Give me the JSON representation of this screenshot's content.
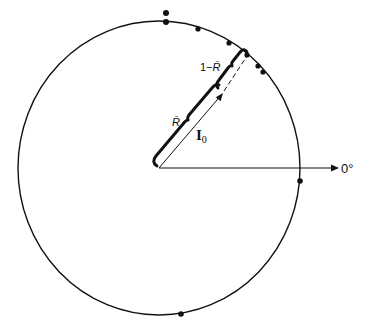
{
  "diagram": {
    "type": "phase-circle",
    "colors": {
      "ink": "#111111",
      "background": "#ffffff"
    },
    "labels": {
      "zero_angle": "0°",
      "mean_vector": "I",
      "mean_vector_subscript": "0",
      "resultant_length": "R̄",
      "complement_prefix": "1−",
      "complement_symbol": "R̄"
    },
    "circle": {
      "center": [
        159,
        168
      ],
      "radius_x": 141,
      "radius_y": 147
    },
    "reference_axis": {
      "from": [
        159,
        168
      ],
      "to": [
        339,
        168
      ]
    },
    "mean_vector": {
      "from": [
        159,
        168
      ],
      "to": [
        223,
        93
      ],
      "extension_to_circle": [
        247,
        55
      ]
    },
    "data_points": [
      {
        "x": 166,
        "y": 13,
        "stacked": true
      },
      {
        "x": 166,
        "y": 22
      },
      {
        "x": 198,
        "y": 29
      },
      {
        "x": 229,
        "y": 43
      },
      {
        "x": 247,
        "y": 55
      },
      {
        "x": 258,
        "y": 66
      },
      {
        "x": 263,
        "y": 72
      },
      {
        "x": 300,
        "y": 181
      },
      {
        "x": 181,
        "y": 314
      }
    ]
  }
}
